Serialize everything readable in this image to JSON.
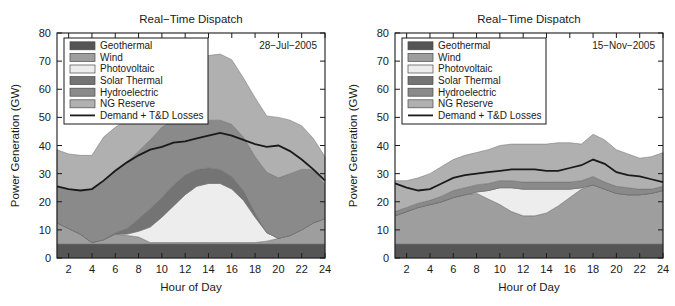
{
  "figure": {
    "width": 675,
    "height": 306,
    "background": "#ffffff"
  },
  "axis": {
    "xlabel": "Hour of Day",
    "ylabel": "Power Generation (GW)",
    "xticks": [
      "2",
      "4",
      "6",
      "8",
      "10",
      "12",
      "14",
      "16",
      "18",
      "20",
      "22",
      "24"
    ],
    "yticks": [
      "0",
      "10",
      "20",
      "30",
      "40",
      "50",
      "60",
      "70",
      "80"
    ],
    "xlim": [
      1,
      24
    ],
    "ylim": [
      0,
      80
    ]
  },
  "colors": {
    "geothermal": "#555555",
    "wind": "#9e9e9e",
    "photovoltaic": "#ededed",
    "solar_thermal": "#747474",
    "hydroelectric": "#8a8a8a",
    "ng_reserve": "#b0b0b0",
    "demand_line": "#1a1a1a",
    "axis": "#1a1a1a",
    "text": "#1a1a1a"
  },
  "legend": {
    "entries": [
      {
        "label": "Geothermal",
        "swatch": "geothermal",
        "type": "patch"
      },
      {
        "label": "Wind",
        "swatch": "wind",
        "type": "patch"
      },
      {
        "label": "Photovoltaic",
        "swatch": "photovoltaic",
        "type": "patch"
      },
      {
        "label": "Solar Thermal",
        "swatch": "solar_thermal",
        "type": "patch"
      },
      {
        "label": "Hydroelectric",
        "swatch": "hydroelectric",
        "type": "patch"
      },
      {
        "label": "NG Reserve",
        "swatch": "ng_reserve",
        "type": "patch"
      },
      {
        "label": "Demand + T&D Losses",
        "swatch": "demand_line",
        "type": "line"
      }
    ]
  },
  "panels": [
    {
      "id": "left",
      "title": "Real-Time Dispatch",
      "date": "28-Jul-2005"
    },
    {
      "id": "right",
      "title": "Real-Time Dispatch",
      "date": "15-Nov-2005"
    }
  ],
  "chart_data": [
    {
      "type": "area",
      "id": "left",
      "title": "Real-Time Dispatch",
      "annotation": "28-Jul-2005",
      "xlabel": "Hour of Day",
      "ylabel": "Power Generation (GW)",
      "xlim": [
        1,
        24
      ],
      "ylim": [
        0,
        80
      ],
      "grid": false,
      "legend_position": "upper-left",
      "stacked": true,
      "x": [
        1,
        2,
        3,
        4,
        5,
        6,
        7,
        8,
        9,
        10,
        11,
        12,
        13,
        14,
        15,
        16,
        17,
        18,
        19,
        20,
        21,
        22,
        23,
        24
      ],
      "series": [
        {
          "name": "Geothermal",
          "color": "#555555",
          "values": [
            5,
            5,
            5,
            5,
            5,
            5,
            5,
            5,
            5,
            5,
            5,
            5,
            5,
            5,
            5,
            5,
            5,
            5,
            5,
            5,
            5,
            5,
            5,
            5
          ]
        },
        {
          "name": "Wind",
          "color": "#9e9e9e",
          "values": [
            7.5,
            5.5,
            3.5,
            0.5,
            1.5,
            3.5,
            3,
            2.5,
            0.5,
            0.5,
            0.5,
            0.5,
            0.5,
            0.5,
            0.5,
            0.5,
            0.5,
            0.5,
            1,
            2,
            3,
            5,
            7.5,
            9
          ]
        },
        {
          "name": "Photovoltaic",
          "color": "#ededed",
          "values": [
            0,
            0,
            0,
            0,
            0,
            0,
            0.5,
            2,
            5.5,
            9,
            13,
            17,
            20,
            21,
            21,
            19,
            15,
            9,
            3,
            0,
            0,
            0,
            0,
            0
          ]
        },
        {
          "name": "Solar Thermal",
          "color": "#747474",
          "values": [
            0,
            0,
            0,
            0,
            0,
            0.5,
            2,
            4.5,
            6.5,
            7,
            7.5,
            7,
            6,
            5.5,
            5,
            4.5,
            3.5,
            1.5,
            0,
            0,
            0,
            0,
            0,
            0
          ]
        },
        {
          "name": "Hydroelectric",
          "color": "#8a8a8a",
          "values": [
            13,
            14,
            15.5,
            19,
            21,
            22,
            23.5,
            24,
            24.5,
            25,
            23,
            21,
            19,
            17,
            17.5,
            18.5,
            19,
            20,
            21.5,
            21.5,
            22,
            21.5,
            19,
            12
          ]
        },
        {
          "name": "NG Reserve",
          "color": "#b0b0b0",
          "values": [
            13,
            12.5,
            12.5,
            12,
            15.5,
            15.5,
            15,
            15,
            15,
            16,
            18,
            19.5,
            21,
            23,
            23.5,
            23,
            21,
            21,
            20,
            21.5,
            19,
            15.5,
            11,
            10
          ]
        }
      ],
      "demand_line": {
        "name": "Demand + T&D Losses",
        "color": "#1a1a1a",
        "values": [
          25.5,
          24.5,
          24,
          24.5,
          27.5,
          31,
          34,
          36.5,
          38.5,
          39.5,
          41,
          41.5,
          42.5,
          43.5,
          44.5,
          43.5,
          42,
          40.5,
          39.5,
          40,
          38,
          35,
          31.5,
          27.5
        ]
      }
    },
    {
      "type": "area",
      "id": "right",
      "title": "Real-Time Dispatch",
      "annotation": "15-Nov-2005",
      "xlabel": "Hour of Day",
      "ylabel": "Power Generation (GW)",
      "xlim": [
        1,
        24
      ],
      "ylim": [
        0,
        80
      ],
      "grid": false,
      "legend_position": "upper-left",
      "stacked": true,
      "x": [
        1,
        2,
        3,
        4,
        5,
        6,
        7,
        8,
        9,
        10,
        11,
        12,
        13,
        14,
        15,
        16,
        17,
        18,
        19,
        20,
        21,
        22,
        23,
        24
      ],
      "series": [
        {
          "name": "Geothermal",
          "color": "#555555",
          "values": [
            5,
            5,
            5,
            5,
            5,
            5,
            5,
            5,
            5,
            5,
            5,
            5,
            5,
            5,
            5,
            5,
            5,
            5,
            5,
            5,
            5,
            5,
            5,
            5
          ]
        },
        {
          "name": "Wind",
          "color": "#9e9e9e",
          "values": [
            10,
            11.5,
            13,
            14,
            15,
            16.5,
            17.5,
            18,
            16,
            14,
            11.5,
            10,
            10,
            11,
            13.5,
            16.5,
            19.5,
            21,
            19.5,
            18,
            17.5,
            17.5,
            18,
            19
          ]
        },
        {
          "name": "Photovoltaic",
          "color": "#ededed",
          "values": [
            0,
            0,
            0,
            0,
            0,
            0,
            0,
            0.5,
            3,
            6,
            8.5,
            9.5,
            9.5,
            8.5,
            6,
            3,
            0.5,
            0,
            0,
            0,
            0,
            0,
            0,
            0
          ]
        },
        {
          "name": "Solar Thermal",
          "color": "#747474",
          "values": [
            0,
            0,
            0,
            0,
            0,
            0,
            0,
            0,
            0,
            0,
            0,
            0,
            0,
            0,
            0,
            0,
            0,
            0,
            0,
            0,
            0,
            0,
            0,
            0
          ]
        },
        {
          "name": "Hydroelectric",
          "color": "#8a8a8a",
          "values": [
            1.5,
            1.5,
            1.5,
            1.5,
            2,
            2.5,
            2.5,
            2.5,
            2.5,
            2.5,
            2.5,
            2.5,
            2.5,
            2.5,
            2.5,
            2.5,
            2.5,
            3,
            2.5,
            2.5,
            2.5,
            2,
            1.5,
            1.5
          ]
        },
        {
          "name": "NG Reserve",
          "color": "#b0b0b0",
          "values": [
            11,
            9.5,
            9,
            9.5,
            10.5,
            11,
            11.5,
            11.5,
            12,
            12.5,
            13,
            13.5,
            13.5,
            13.5,
            14,
            14,
            13,
            15,
            15,
            13,
            12,
            11,
            11.5,
            12
          ]
        }
      ],
      "demand_line": {
        "name": "Demand + T&D Losses",
        "color": "#1a1a1a",
        "values": [
          26.5,
          25,
          24,
          24.5,
          26.5,
          28.5,
          29.5,
          30,
          30.5,
          31,
          31.5,
          31.5,
          31.5,
          31,
          31,
          32,
          33,
          35,
          33.5,
          30.5,
          29.5,
          29,
          28,
          27
        ]
      }
    }
  ]
}
